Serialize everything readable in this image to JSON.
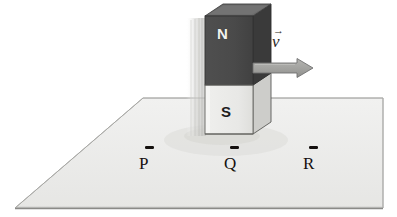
{
  "figure": {
    "background_color": "#ffffff"
  },
  "plane": {
    "name": "horizontal-plane",
    "fill_color": "#ececeb",
    "edge_color": "#8d8d8a",
    "shape": "parallelogram",
    "corners": [
      [
        15,
        208
      ],
      [
        143,
        98
      ],
      [
        383,
        98
      ],
      [
        383,
        208
      ]
    ]
  },
  "magnet": {
    "name": "bar-magnet",
    "north": {
      "label": "N",
      "fill_color": "#4a4a4a",
      "text_color": "#f2f2f0"
    },
    "south": {
      "label": "S",
      "fill_color": "#e9e9e7",
      "text_color": "#1d1d1d"
    },
    "side_face_color": "#c9c9c6",
    "side_face_color_dark": "#343434",
    "top_face_color": "#6b6b6b",
    "outline_color": "#4f4f4c",
    "front_left_x": 205,
    "front_right_x": 253,
    "top_y": 16,
    "bottom_y": 134,
    "pole_boundary_y": 73,
    "depth_dx": 18,
    "depth_dy": -12
  },
  "velocity": {
    "name": "velocity-vector",
    "symbol": "v",
    "arrow_glyph": "→",
    "label_full": "v⃗",
    "arrow_color": "#a6a6a3",
    "arrow_outline_color": "#6e6e6b",
    "arrow_start_x": 253,
    "arrow_end_x": 312,
    "arrow_y": 68,
    "direction": "right"
  },
  "points": [
    {
      "id": "P",
      "label": "P",
      "tick": "–",
      "x": 145,
      "y": 160
    },
    {
      "id": "Q",
      "label": "Q",
      "tick": "–",
      "x": 230,
      "y": 160
    },
    {
      "id": "R",
      "label": "R",
      "tick": "–",
      "x": 309,
      "y": 160
    }
  ],
  "colors": {
    "plane_fill": "#ececeb",
    "magnet_north": "#4a4a4a",
    "magnet_south": "#e9e9e7",
    "arrow_gray": "#a6a6a3",
    "ink": "#15110f"
  }
}
